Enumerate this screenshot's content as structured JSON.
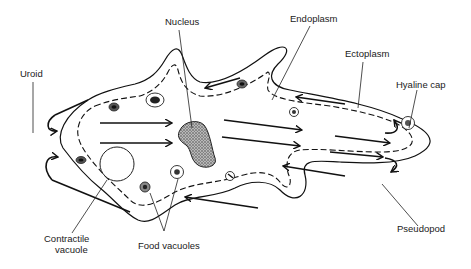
{
  "diagram": {
    "labels": {
      "nucleus": "Nucleus",
      "endoplasm": "Endoplasm",
      "ectoplasm": "Ectoplasm",
      "uroid": "Uroid",
      "hyaline_cap": "Hyaline cap",
      "pseudopod": "Pseudopod",
      "contractile_vacuole_line1": "Contractile",
      "contractile_vacuole_line2": "vacuole",
      "food_vacuoles": "Food vacuoles"
    },
    "colors": {
      "ink": "#111111",
      "background": "#ffffff",
      "stipple": "#444444"
    }
  }
}
